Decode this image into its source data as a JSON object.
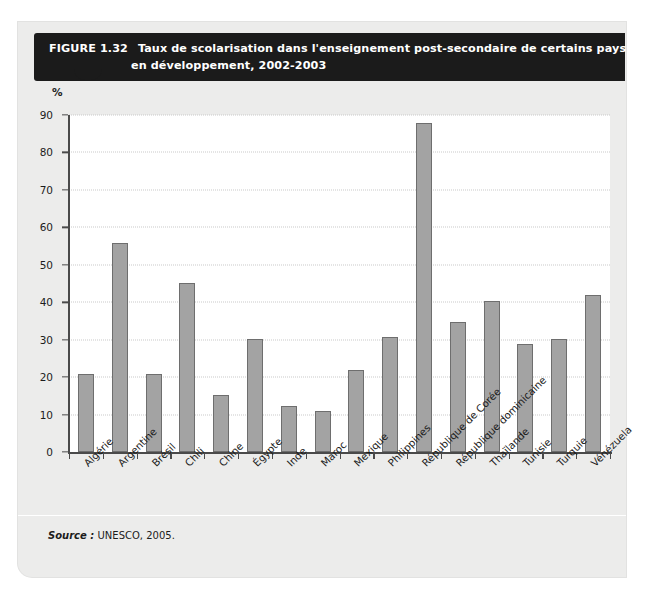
{
  "figure": {
    "number_label": "FIGURE 1.32",
    "title_line1": "Taux de scolarisation dans l'enseignement post-secondaire de certains pays",
    "title_line2": "en développement, 2002-2003",
    "source_label": "Source :",
    "source_text": " UNESCO, 2005.",
    "accent_dark": "#1b1b1b",
    "bar_fill": "#a3a3a3",
    "bar_stroke": "#6e6e6e",
    "card_bg": "#ececeb",
    "plot_bg": "#ffffff"
  },
  "chart_data": {
    "type": "bar",
    "title": "Taux de scolarisation dans l'enseignement post-secondaire de certains pays en développement, 2002-2003",
    "xlabel": "",
    "ylabel": "%",
    "ylim": [
      0,
      90
    ],
    "yticks": [
      0,
      10,
      20,
      30,
      40,
      50,
      60,
      70,
      80,
      90
    ],
    "grid": "horizontal-dotted",
    "legend": "none",
    "categories": [
      "Algérie",
      "Argentine",
      "Brésil",
      "Chili",
      "Chine",
      "Égypte",
      "Inde",
      "Maroc",
      "Mexique",
      "Philippines",
      "République de Corée",
      "République dominicaine",
      "Thaïlande",
      "Tunisie",
      "Turquie",
      "Vénézuela"
    ],
    "values": [
      20.8,
      55.7,
      20.8,
      45.2,
      15.1,
      30.3,
      12.2,
      10.9,
      21.8,
      30.8,
      87.8,
      34.6,
      40.3,
      28.8,
      30.2,
      41.9
    ]
  }
}
